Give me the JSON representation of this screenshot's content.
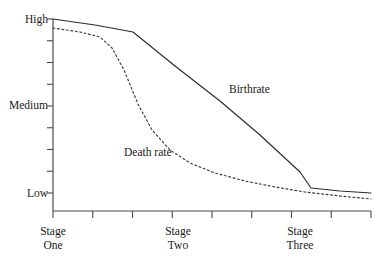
{
  "chart_data": {
    "type": "line",
    "title": "",
    "subtitle": "",
    "xlabel": "",
    "ylabel": "",
    "grid": false,
    "legend_position": "inline-annotation",
    "y_tick_labels": [
      "High",
      "Medium",
      "Low"
    ],
    "y_axis_categories": [
      "Low",
      "Medium",
      "High"
    ],
    "y_tick_label_high": "High",
    "y_tick_label_medium": "Medium",
    "y_tick_label_low": "Low",
    "y_minor_tick_count": 9,
    "x_tick_count": 9,
    "x_categories": [
      "Stage One",
      "Stage Two",
      "Stage Three"
    ],
    "x_tick_labels": [
      {
        "line1": "Stage",
        "line2": "One",
        "x_px": 53
      },
      {
        "line1": "Stage",
        "line2": "Two",
        "x_px": 178
      },
      {
        "line1": "Stage",
        "line2": "Three",
        "x_px": 300
      }
    ],
    "annotations": [
      {
        "text": "Birthrate",
        "x_px": 229,
        "y_px": 93
      },
      {
        "text": "Death rate",
        "x_px": 124,
        "y_px": 156
      }
    ],
    "series": [
      {
        "name": "Birthrate",
        "style": "solid",
        "color": "#2b2b2b",
        "points_px": [
          [
            53,
            19
          ],
          [
            95,
            25
          ],
          [
            133,
            32
          ],
          [
            175,
            66
          ],
          [
            220,
            101
          ],
          [
            260,
            135
          ],
          [
            300,
            172
          ],
          [
            311,
            188
          ],
          [
            340,
            191
          ],
          [
            371,
            193
          ]
        ],
        "values": [
          {
            "stage": "Stage One start",
            "level": "High"
          },
          {
            "stage": "Stage One end",
            "level": "High"
          },
          {
            "stage": "Stage Two start",
            "level": "High"
          },
          {
            "stage": "Stage Two mid",
            "level": "Medium-High"
          },
          {
            "stage": "Stage Two end",
            "level": "Medium"
          },
          {
            "stage": "Stage Three start",
            "level": "Low-Medium"
          },
          {
            "stage": "Stage Three mid",
            "level": "Low"
          },
          {
            "stage": "Stage Three end",
            "level": "Low"
          }
        ]
      },
      {
        "name": "Death rate",
        "style": "dotted",
        "color": "#3a3a3a",
        "points_px": [
          [
            53,
            28
          ],
          [
            80,
            32
          ],
          [
            100,
            37
          ],
          [
            112,
            48
          ],
          [
            124,
            70
          ],
          [
            138,
            104
          ],
          [
            152,
            130
          ],
          [
            170,
            150
          ],
          [
            190,
            163
          ],
          [
            215,
            173
          ],
          [
            245,
            181
          ],
          [
            275,
            187
          ],
          [
            305,
            192
          ],
          [
            340,
            196
          ],
          [
            371,
            199
          ]
        ],
        "values": [
          {
            "stage": "Stage One start",
            "level": "High"
          },
          {
            "stage": "Stage One end",
            "level": "High"
          },
          {
            "stage": "Stage Two start",
            "level": "Medium-High"
          },
          {
            "stage": "Stage Two mid",
            "level": "Medium"
          },
          {
            "stage": "Stage Two end",
            "level": "Low"
          },
          {
            "stage": "Stage Three start",
            "level": "Low"
          },
          {
            "stage": "Stage Three end",
            "level": "Low"
          }
        ]
      }
    ],
    "axis_geometry": {
      "x_origin_px": 53,
      "x_end_px": 371,
      "y_top_px": 19,
      "y_bottom_px": 211,
      "y_high_px": 19,
      "y_medium_px": 105,
      "y_low_px": 193
    },
    "colors": {
      "axis": "#4a4a4a",
      "birthrate": "#2b2b2b",
      "deathrate": "#3a3a3a",
      "background": "#ffffff",
      "text": "#1a1a1a"
    }
  }
}
